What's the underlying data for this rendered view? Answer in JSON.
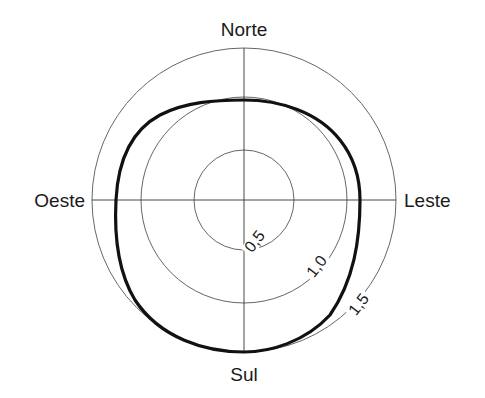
{
  "diagram": {
    "type": "polar",
    "center": [
      244,
      200
    ],
    "directions": {
      "north": "Norte",
      "east": "Leste",
      "south": "Sul",
      "west": "Oeste"
    },
    "rings": [
      {
        "value": 0.5,
        "label": "0,5",
        "radius": 50
      },
      {
        "value": 1.0,
        "label": "1,0",
        "radius": 103
      },
      {
        "value": 1.5,
        "label": "1,5",
        "radius": 152
      }
    ],
    "curve_description": "Closed thick curve: approx. r=1.0 toward Norte, ~1.1 toward Leste, ~1.5 toward Sul, ~1.25 toward Oeste",
    "colors": {
      "grid": "#555555",
      "curve": "#111111",
      "text": "#1a1a1a",
      "background": "#ffffff"
    }
  }
}
